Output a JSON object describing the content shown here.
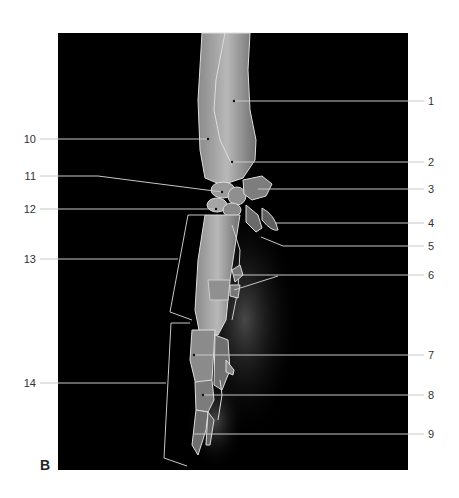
{
  "figure": {
    "panel_letter": "B",
    "background_color": "#000000",
    "leader_line_color": "#bdbdbd",
    "labels_right": [
      {
        "id": "1",
        "y": 101
      },
      {
        "id": "2",
        "y": 162
      },
      {
        "id": "3",
        "y": 189
      },
      {
        "id": "4",
        "y": 223
      },
      {
        "id": "5",
        "y": 246
      },
      {
        "id": "6",
        "y": 275
      },
      {
        "id": "7",
        "y": 355
      },
      {
        "id": "8",
        "y": 395
      },
      {
        "id": "9",
        "y": 434
      }
    ],
    "labels_left": [
      {
        "id": "10",
        "y": 139
      },
      {
        "id": "11",
        "y": 176
      },
      {
        "id": "12",
        "y": 209
      },
      {
        "id": "13",
        "y": 259
      },
      {
        "id": "14",
        "y": 383
      }
    ]
  }
}
